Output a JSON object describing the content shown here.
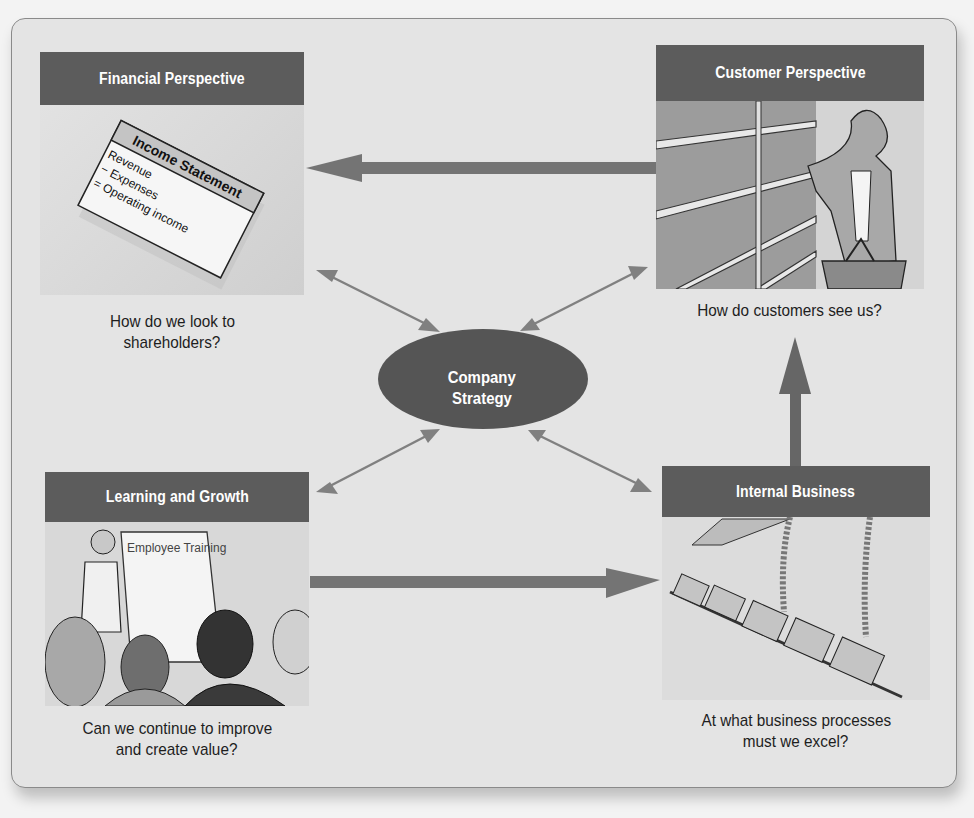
{
  "diagram": {
    "title_implied": "Balanced Scorecard",
    "center": {
      "line1": "Company",
      "line2": "Strategy"
    },
    "panels": {
      "financial": {
        "header": "Financial Perspective",
        "illustration": {
          "label": "Income Statement",
          "lines": [
            "Revenue",
            "− Expenses",
            "= Operating income"
          ]
        },
        "caption_line1": "How do we look to",
        "caption_line2": "shareholders?"
      },
      "customer": {
        "header": "Customer Perspective",
        "illustration": {
          "description": "Woman shopper with basket reaching for product on store shelves"
        },
        "caption_line1": "How do customers see us?"
      },
      "learning": {
        "header": "Learning and Growth",
        "illustration": {
          "label": "Employee Training",
          "description": "Presenter at flip chart addressing audience"
        },
        "caption_line1": "Can we continue to improve",
        "caption_line2": "and create value?"
      },
      "internal": {
        "header": "Internal Business",
        "illustration": {
          "description": "Car assembly line with hanging cables"
        },
        "caption_line1": "At what business processes",
        "caption_line2": "must we excel?"
      }
    },
    "flows": [
      {
        "from": "Customer Perspective",
        "to": "Financial Perspective",
        "type": "thick-arrow"
      },
      {
        "from": "Learning and Growth",
        "to": "Internal Business",
        "type": "thick-arrow"
      },
      {
        "from": "Internal Business",
        "to": "Customer Perspective",
        "type": "thick-arrow"
      },
      {
        "from": "Company Strategy",
        "to": "Financial Perspective",
        "type": "double-arrow"
      },
      {
        "from": "Company Strategy",
        "to": "Customer Perspective",
        "type": "double-arrow"
      },
      {
        "from": "Company Strategy",
        "to": "Learning and Growth",
        "type": "double-arrow"
      },
      {
        "from": "Company Strategy",
        "to": "Internal Business",
        "type": "double-arrow"
      }
    ],
    "colors": {
      "header_bg": "#5c5c5c",
      "ellipse_bg": "#555555",
      "arrow": "#777777",
      "frame_bg": "#e4e4e4"
    }
  }
}
